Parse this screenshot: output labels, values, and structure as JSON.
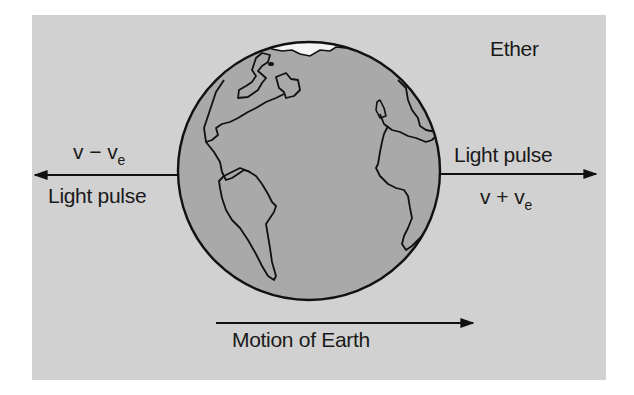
{
  "diagram": {
    "title_label": "Ether",
    "left": {
      "velocity": {
        "base": "v",
        "operator": "−",
        "term": "v",
        "subscript": "e"
      },
      "label": "Light pulse",
      "arrow_direction": "left"
    },
    "right": {
      "velocity": {
        "base": "v",
        "operator": "+",
        "term": "v",
        "subscript": "e"
      },
      "label": "Light pulse",
      "arrow_direction": "right"
    },
    "bottom": {
      "label": "Motion of Earth",
      "arrow_direction": "right"
    },
    "center_object": "Earth globe (Americas, Europe, Africa visible)",
    "colors": {
      "panel_background": "#d1d1d1",
      "globe_fill": "#a9a9a9",
      "polar_cap": "#f4f4f4",
      "stroke": "#111111",
      "text": "#1a1a1a"
    }
  }
}
